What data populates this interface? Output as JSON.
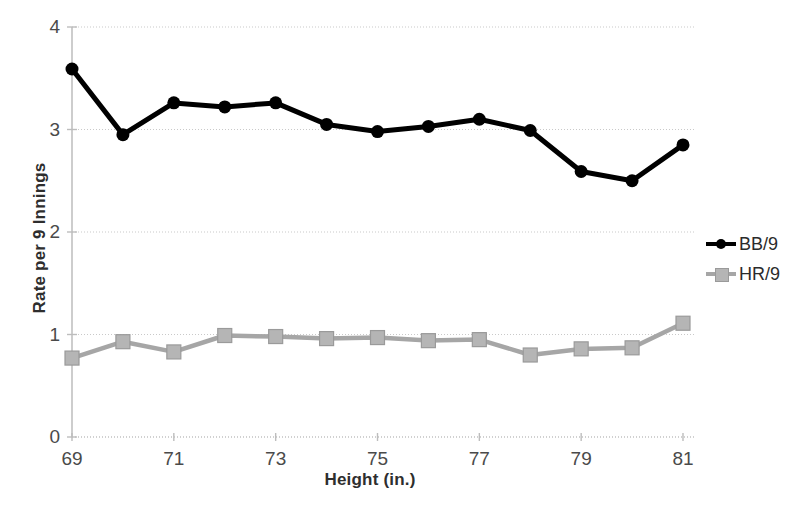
{
  "chart_data": {
    "type": "line",
    "title": "",
    "xlabel": "Height (in.)",
    "ylabel": "Rate per 9 Innings",
    "x": [
      69,
      70,
      71,
      72,
      73,
      74,
      75,
      76,
      77,
      78,
      79,
      80,
      81
    ],
    "xlim": [
      69,
      81
    ],
    "ylim": [
      0,
      4
    ],
    "xticks": [
      69,
      71,
      73,
      75,
      77,
      79,
      81
    ],
    "xticklabels": [
      "69",
      "71",
      "73",
      "75",
      "77",
      "79",
      "81"
    ],
    "yticks": [
      0,
      1,
      2,
      3,
      4
    ],
    "yticklabels": [
      "0",
      "1",
      "2",
      "3",
      "4"
    ],
    "grid": "horizontal-dotted",
    "legend_position": "right",
    "series": [
      {
        "name": "BB/9",
        "color": "#000000",
        "marker": "circle",
        "values": [
          3.59,
          2.95,
          3.26,
          3.22,
          3.26,
          3.05,
          2.98,
          3.03,
          3.1,
          2.99,
          2.59,
          2.5,
          2.85
        ]
      },
      {
        "name": "HR/9",
        "color": "#a6a6a6",
        "marker": "square",
        "values": [
          0.77,
          0.93,
          0.83,
          0.99,
          0.98,
          0.96,
          0.97,
          0.94,
          0.95,
          0.8,
          0.86,
          0.87,
          1.11
        ]
      }
    ]
  },
  "legend": {
    "items": [
      {
        "label": "BB/9"
      },
      {
        "label": "HR/9"
      }
    ]
  },
  "axes": {
    "x_title": "Height (in.)",
    "y_title": "Rate per 9 Innings"
  },
  "colors": {
    "bb_series": "#000000",
    "hr_series": "#a6a6a6",
    "gridline": "#c9c9c9",
    "axis_line": "#bdbdbd",
    "tick_text": "#4a4a4a",
    "title_text": "#2e2e2e"
  }
}
